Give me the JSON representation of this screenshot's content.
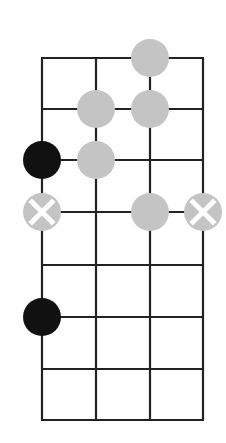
{
  "diagram": {
    "colors": {
      "grid": "#222222",
      "note": "#c4c4c4",
      "root": "#111111",
      "cross": "#ffffff",
      "background": "#ffffff"
    },
    "grid": {
      "strings_x": [
        42,
        96,
        150,
        203
      ],
      "frets_y": [
        58,
        109,
        160,
        212,
        265,
        317,
        369,
        420
      ],
      "line_width": 2.2
    },
    "dot_radius": 19,
    "notes": [
      {
        "string": 2,
        "fret": 0,
        "type": "note"
      },
      {
        "string": 1,
        "fret": 1,
        "type": "note"
      },
      {
        "string": 2,
        "fret": 1,
        "type": "note"
      },
      {
        "string": 0,
        "fret": 2,
        "type": "root"
      },
      {
        "string": 1,
        "fret": 2,
        "type": "note"
      },
      {
        "string": 0,
        "fret": 3,
        "type": "cross"
      },
      {
        "string": 2,
        "fret": 3,
        "type": "note"
      },
      {
        "string": 3,
        "fret": 3,
        "type": "cross"
      },
      {
        "string": 0,
        "fret": 5,
        "type": "root"
      }
    ]
  }
}
